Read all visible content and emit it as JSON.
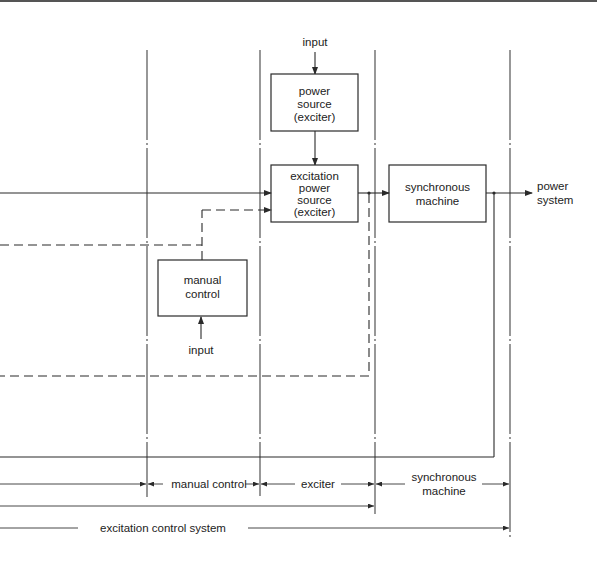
{
  "diagram": {
    "type": "block-diagram",
    "title": "",
    "blocks": {
      "power_source": {
        "line1": "power",
        "line2": "source",
        "line3": "(exciter)"
      },
      "excitation_power_source": {
        "line1": "excitation",
        "line2": "power",
        "line3": "source",
        "line4": "(exciter)"
      },
      "synchronous_machine": {
        "line1": "synchronous",
        "line2": "machine"
      },
      "manual_control": {
        "line1": "manual",
        "line2": "control"
      }
    },
    "labels": {
      "input_top": "input",
      "input_manual": "input",
      "power_system_line1": "power",
      "power_system_line2": "system"
    },
    "dimensions": {
      "manual_control": "manual control",
      "exciter": "exciter",
      "synchronous_machine_line1": "synchronous",
      "synchronous_machine_line2": "machine",
      "excitation_control_system": "excitation control system"
    },
    "colors": {
      "line": "#2a2a2a",
      "background": "#ffffff"
    }
  }
}
